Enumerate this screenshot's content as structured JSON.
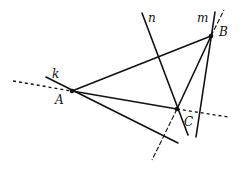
{
  "diagram": {
    "points": [
      {
        "id": "A",
        "label": "A",
        "x": 72,
        "y": 91
      },
      {
        "id": "B",
        "label": "B",
        "x": 211,
        "y": 36
      },
      {
        "id": "C",
        "label": "C",
        "x": 177,
        "y": 109
      }
    ],
    "lines": [
      {
        "id": "k",
        "label": "k"
      },
      {
        "id": "m",
        "label": "m"
      },
      {
        "id": "n",
        "label": "n"
      }
    ],
    "labels": {
      "A": "A",
      "B": "B",
      "C": "C",
      "k": "k",
      "m": "m",
      "n": "n"
    }
  }
}
